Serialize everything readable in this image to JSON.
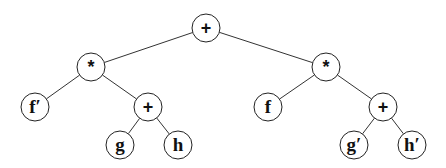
{
  "diagram": {
    "type": "expression-tree",
    "nodes": [
      {
        "id": "root",
        "label": "+",
        "x": 206,
        "y": 28,
        "kind": "op"
      },
      {
        "id": "mulL",
        "label": "*",
        "x": 91,
        "y": 67,
        "kind": "op"
      },
      {
        "id": "mulR",
        "label": "*",
        "x": 326,
        "y": 67,
        "kind": "op"
      },
      {
        "id": "fprime",
        "label": "f′",
        "x": 35,
        "y": 107,
        "kind": "var"
      },
      {
        "id": "plusL",
        "label": "+",
        "x": 148,
        "y": 107,
        "kind": "op"
      },
      {
        "id": "g",
        "label": "g",
        "x": 120,
        "y": 145,
        "kind": "var"
      },
      {
        "id": "h",
        "label": "h",
        "x": 178,
        "y": 145,
        "kind": "var"
      },
      {
        "id": "f",
        "label": "f",
        "x": 268,
        "y": 107,
        "kind": "var"
      },
      {
        "id": "plusR",
        "label": "+",
        "x": 383,
        "y": 107,
        "kind": "op"
      },
      {
        "id": "gprime",
        "label": "g′",
        "x": 354,
        "y": 145,
        "kind": "var"
      },
      {
        "id": "hprime",
        "label": "h′",
        "x": 412,
        "y": 145,
        "kind": "var"
      }
    ],
    "edges": [
      [
        "root",
        "mulL"
      ],
      [
        "root",
        "mulR"
      ],
      [
        "mulL",
        "fprime"
      ],
      [
        "mulL",
        "plusL"
      ],
      [
        "plusL",
        "g"
      ],
      [
        "plusL",
        "h"
      ],
      [
        "mulR",
        "f"
      ],
      [
        "mulR",
        "plusR"
      ],
      [
        "plusR",
        "gprime"
      ],
      [
        "plusR",
        "hprime"
      ]
    ],
    "node_radius": 14
  }
}
